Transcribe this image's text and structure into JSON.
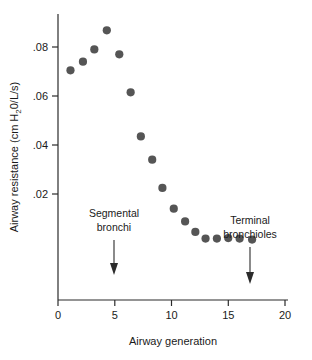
{
  "chart_data": {
    "type": "scatter",
    "title": "",
    "xlabel": "Airway generation",
    "ylabel": "Airway resistance (cm H20/L/s)",
    "ylabel_parts": {
      "before": "Airway resistance (cm H",
      "subscript": "2",
      "after": "0/L/s)"
    },
    "xlim": [
      0,
      20
    ],
    "ylim": [
      0,
      0.09
    ],
    "xticks": [
      0,
      5,
      10,
      15,
      20
    ],
    "xtick_labels": [
      "0",
      "5",
      "10",
      "15",
      "20"
    ],
    "yticks": [
      0.02,
      0.04,
      0.06,
      0.08
    ],
    "ytick_labels": [
      ".02",
      ".04",
      ".06",
      ".08"
    ],
    "grid": false,
    "legend": null,
    "marker": {
      "shape": "circle",
      "color": "#555555",
      "size_px": 5
    },
    "x": [
      1.1,
      2.2,
      3.2,
      4.3,
      5.4,
      6.4,
      7.3,
      8.3,
      9.2,
      10.2,
      11.2,
      12.1,
      13.0,
      14.0,
      15.0,
      16.0,
      17.1
    ],
    "y": [
      0.0705,
      0.074,
      0.079,
      0.0868,
      0.077,
      0.0615,
      0.0435,
      0.034,
      0.0225,
      0.014,
      0.0088,
      0.0045,
      0.0018,
      0.0018,
      0.002,
      0.0018,
      0.0014
    ],
    "annotations": [
      {
        "id": "segmental-bronchi",
        "lines": [
          "Segmental",
          "bronchi"
        ],
        "x": 5.0,
        "arrow": "down"
      },
      {
        "id": "terminal-bronchioles",
        "lines": [
          "Terminal",
          "bronchioles"
        ],
        "x": 16.0,
        "arrow": "down"
      }
    ]
  }
}
